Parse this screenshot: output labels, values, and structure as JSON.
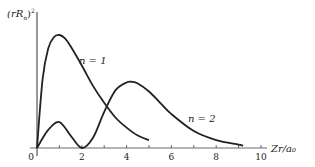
{
  "chart_data": {
    "type": "line",
    "title": "",
    "xlabel": "Zr/a0",
    "ylabel": "(rRn)^2",
    "xlim": [
      0,
      10.5
    ],
    "ylim": [
      0,
      1.0
    ],
    "grid": false,
    "legend": "inline labels",
    "x_ticks": [
      0,
      2,
      4,
      6,
      8,
      10
    ],
    "x_tick_labels": [
      "0",
      "2",
      "4",
      "6",
      "8",
      "10"
    ],
    "series": [
      {
        "name": "n = 1",
        "x": [
          0,
          0.25,
          0.5,
          0.75,
          1.0,
          1.25,
          1.5,
          2.0,
          2.5,
          3.0,
          3.5,
          4.0,
          4.5,
          5.0
        ],
        "values": [
          0,
          0.61,
          0.88,
          0.98,
          1.0,
          0.97,
          0.9,
          0.73,
          0.55,
          0.4,
          0.27,
          0.18,
          0.11,
          0.07
        ]
      },
      {
        "name": "n = 2",
        "x": [
          0,
          0.5,
          1.0,
          1.5,
          2.0,
          2.5,
          3.0,
          3.5,
          4.0,
          4.25,
          4.5,
          5.0,
          5.5,
          6.0,
          7.0,
          8.0,
          9.0,
          9.2
        ],
        "values": [
          0,
          0.16,
          0.23,
          0.11,
          0,
          0.09,
          0.32,
          0.51,
          0.58,
          0.585,
          0.57,
          0.5,
          0.4,
          0.3,
          0.15,
          0.07,
          0.03,
          0.02
        ]
      }
    ],
    "annotations": [
      {
        "text": "n = 1",
        "x": 2.3,
        "y": 0.8
      },
      {
        "text": "n = 2",
        "x": 6.2,
        "y": 0.45
      }
    ]
  },
  "labels": {
    "ylabel": "(rRn)²",
    "ylabel_main": "(rR",
    "ylabel_sub": "n",
    "ylabel_close": ")",
    "ylabel_sup": "2",
    "xlabel": "Zr/a₀",
    "n1": "n = 1",
    "n2": "n = 2",
    "ticks": [
      "0",
      "2",
      "4",
      "6",
      "8",
      "10"
    ]
  }
}
